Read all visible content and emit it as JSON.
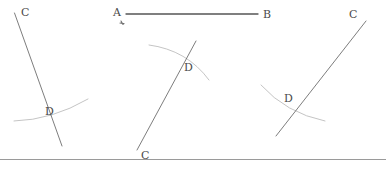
{
  "canvas": {
    "width": 386,
    "height": 171,
    "background": "#ffffff"
  },
  "style": {
    "ray_color": "#6e6e6e",
    "ray_width": 0.9,
    "arc_color": "#bdbdbd",
    "arc_width": 0.9,
    "segment_color": "#555555",
    "segment_width": 1.3,
    "label_color": "#4a4a4a",
    "baseline_color": "#9a9a9a",
    "tick_color": "#707070"
  },
  "baseline": {
    "name": "bottom-rule",
    "x1": 0,
    "y1": 159.5,
    "x2": 386,
    "y2": 159.5
  },
  "segment_ab": {
    "label_a": "A",
    "label_b": "B",
    "a_x": 113,
    "a_y": 7,
    "b_x": 263,
    "b_y": 9,
    "line_x1": 126,
    "line_y1": 14,
    "line_x2": 258,
    "line_y2": 14,
    "tick_x": 120,
    "tick_y": 21,
    "tick_label": "construction-tick"
  },
  "figures": [
    {
      "id": "figure-left",
      "ray": {
        "x1": 14.5,
        "y1": 13,
        "x2": 62,
        "y2": 146
      },
      "arc": {
        "d": "M 14 121 Q 52 120 88 99"
      },
      "labels": [
        {
          "name": "label-c-left",
          "text": "C",
          "x": 21,
          "y": 7
        },
        {
          "name": "label-d-left",
          "text": "D",
          "x": 45,
          "y": 106
        }
      ]
    },
    {
      "id": "figure-middle",
      "ray": {
        "x1": 196,
        "y1": 41,
        "x2": 137,
        "y2": 150
      },
      "arc": {
        "d": "M 149 45 Q 187 50 209 80"
      },
      "labels": [
        {
          "name": "label-c-middle",
          "text": "C",
          "x": 141,
          "y": 150
        },
        {
          "name": "label-d-middle",
          "text": "D",
          "x": 184,
          "y": 62
        }
      ]
    },
    {
      "id": "figure-right",
      "ray": {
        "x1": 366,
        "y1": 21,
        "x2": 276,
        "y2": 136
      },
      "arc": {
        "d": "M 261 85 Q 286 113 325 121"
      },
      "labels": [
        {
          "name": "label-c-right",
          "text": "C",
          "x": 349,
          "y": 9
        },
        {
          "name": "label-d-right",
          "text": "D",
          "x": 284,
          "y": 93
        }
      ]
    }
  ]
}
